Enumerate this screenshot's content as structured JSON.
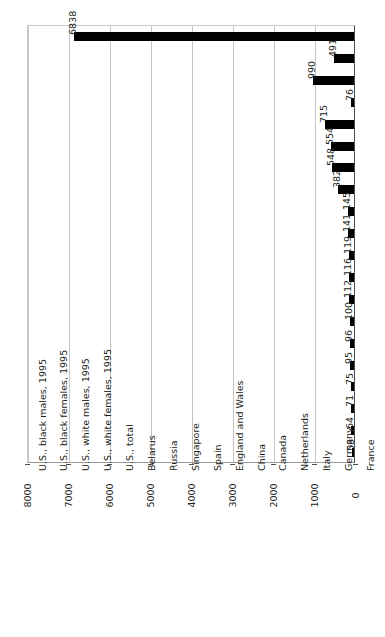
{
  "chart_data": {
    "type": "bar",
    "title": "Incarceration Rates Per 100,000 People of Select Nations and Groups",
    "xlabel": "",
    "ylabel": "",
    "orientation": "vertical-rotated",
    "grid": true,
    "legend": "none",
    "ylim": [
      0,
      8000
    ],
    "ticks": [
      "0",
      "1000",
      "2000",
      "3000",
      "4000",
      "5000",
      "6000",
      "7000",
      "8000"
    ],
    "categories": [
      "U.S., black males, 1995",
      "U.S., black females, 1995",
      "U.S., white males, 1995",
      "U.S., white females, 1995",
      "U.S., total",
      "Belarus",
      "Russia",
      "Singapore",
      "Spain",
      "England and Wales",
      "China",
      "Canada",
      "Netherlands",
      "Italy",
      "Germany",
      "France",
      "Sweden",
      "Finland",
      "Norway",
      "Japan"
    ],
    "values": [
      6838,
      491,
      990,
      76,
      715,
      554,
      548,
      382,
      145,
      141,
      119,
      116,
      112,
      100,
      96,
      95,
      75,
      71,
      64,
      58
    ],
    "bar_color": "#000000"
  }
}
